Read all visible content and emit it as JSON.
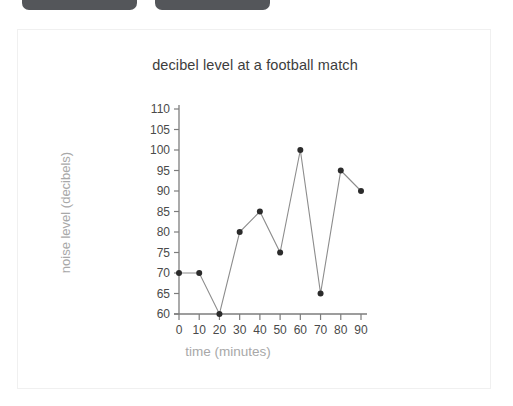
{
  "toolbar": {
    "chips": [
      {
        "name": "toolbar-chip-left",
        "label": ""
      },
      {
        "name": "toolbar-chip-right",
        "label": ""
      }
    ]
  },
  "card": {
    "background": "#ffffff",
    "border_color": "#f0f0f0"
  },
  "chart_data": {
    "type": "line",
    "title": "decibel level at a football match",
    "xlabel": "time (minutes)",
    "ylabel": "noise level (decibels)",
    "x": [
      0,
      10,
      20,
      30,
      40,
      50,
      60,
      70,
      80,
      90
    ],
    "values": [
      70,
      70,
      60,
      80,
      85,
      75,
      100,
      65,
      95,
      90
    ],
    "xlim": [
      0,
      90
    ],
    "ylim": [
      60,
      110
    ],
    "xticks": [
      "0",
      "10",
      "20",
      "30",
      "40",
      "50",
      "60",
      "70",
      "80",
      "90"
    ],
    "yticks": [
      "60",
      "65",
      "70",
      "75",
      "80",
      "85",
      "90",
      "95",
      "100",
      "105",
      "110"
    ],
    "grid": false,
    "legend": null,
    "marker": "circle",
    "line_color": "#8c8c8c",
    "marker_color": "#2b2b2b",
    "title_color": "#3d3d3d",
    "axis_label_color": "#a8a8a8",
    "tick_label_color": "#4a4a4a"
  }
}
